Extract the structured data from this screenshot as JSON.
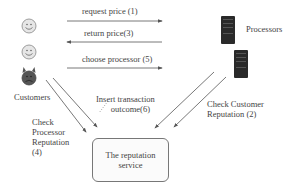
{
  "diagram": {
    "actors": {
      "customers_label": "Customers",
      "processors_label": "Processors"
    },
    "messages": {
      "request_price": "request price (1)",
      "return_price": "return price(3)",
      "choose_processor": "choose processor (5)",
      "check_customer_reputation_line1": "Check Customer",
      "check_customer_reputation_line2": "Reputation (2)",
      "check_processor_reputation_line1": "Check",
      "check_processor_reputation_line2": "Processor",
      "check_processor_reputation_line3": "Reputation",
      "check_processor_reputation_line4": "(4)",
      "insert_transaction_line1": "Insert transaction",
      "insert_transaction_line2": "outcome(6)"
    },
    "service": {
      "line1": "The reputation",
      "line2": "service"
    },
    "icons": {
      "customer_1": "smiley-face-icon",
      "customer_2": "smiley-face-icon",
      "customer_3": "devil-face-icon",
      "processor_1": "server-tower-icon",
      "processor_2": "server-tower-icon"
    },
    "colors": {
      "line": "#555555",
      "smiley_fill": "#e6e6e6",
      "devil_fill": "#555555",
      "server_fill": "#2a2a2a"
    }
  }
}
